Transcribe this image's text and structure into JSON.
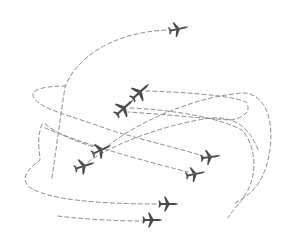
{
  "illustration": {
    "title": "Airplanes with dashed flight paths",
    "background_color": "#ffffff",
    "path_color": "#8a8a8a",
    "plane_color": "#4a4a4a",
    "planes": [
      {
        "id": "plane-1",
        "x": 178,
        "y": 29,
        "rotation": -12,
        "icon": "airplane-icon"
      },
      {
        "id": "plane-2",
        "x": 140,
        "y": 92,
        "rotation": -42,
        "icon": "airplane-icon"
      },
      {
        "id": "plane-3",
        "x": 124,
        "y": 108,
        "rotation": -42,
        "icon": "airplane-icon"
      },
      {
        "id": "plane-4",
        "x": 101,
        "y": 150,
        "rotation": -25,
        "icon": "airplane-icon"
      },
      {
        "id": "plane-5",
        "x": 84,
        "y": 166,
        "rotation": -18,
        "icon": "airplane-icon"
      },
      {
        "id": "plane-6",
        "x": 210,
        "y": 157,
        "rotation": -8,
        "icon": "airplane-icon"
      },
      {
        "id": "plane-7",
        "x": 195,
        "y": 174,
        "rotation": -12,
        "icon": "airplane-icon"
      },
      {
        "id": "plane-8",
        "x": 168,
        "y": 204,
        "rotation": 0,
        "icon": "airplane-icon"
      },
      {
        "id": "plane-9",
        "x": 152,
        "y": 220,
        "rotation": 0,
        "icon": "airplane-icon"
      }
    ]
  }
}
